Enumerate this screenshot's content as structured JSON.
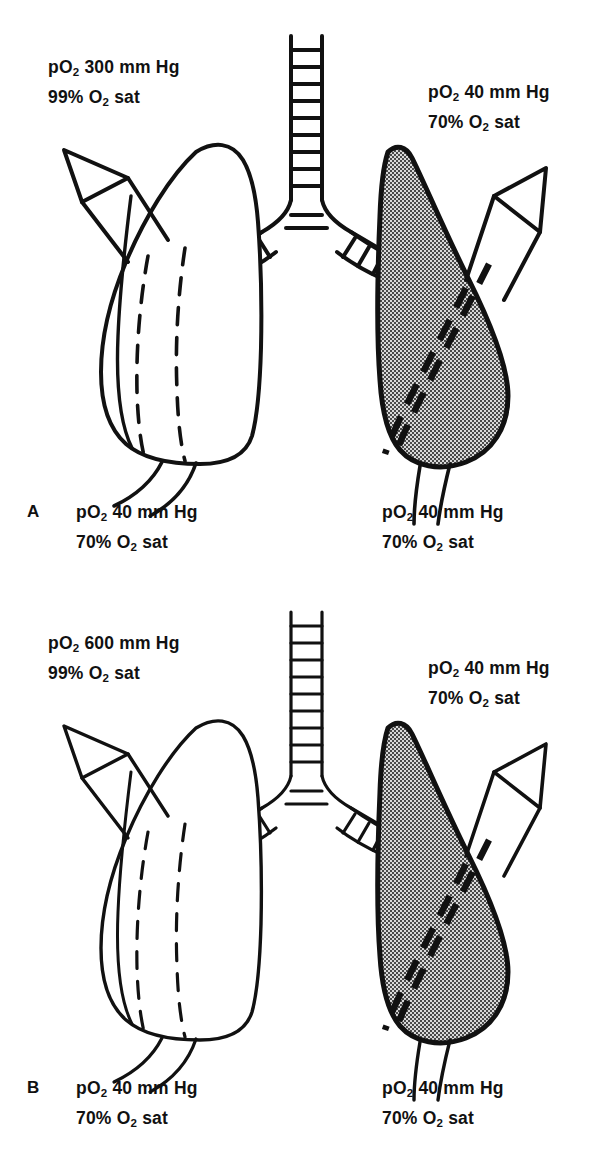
{
  "figure": {
    "type": "medical-diagram",
    "background_color": "#ffffff",
    "ink_color": "#111111",
    "shaded_lung_color": "#8a8a8a"
  },
  "panels": [
    {
      "id": "A",
      "letter": "A",
      "left_lung": {
        "state": "normal-ventilated",
        "fill": "white",
        "arrow_direction": "up-left",
        "inflow_label": {
          "line1_pre": "pO",
          "line1_sub": "2",
          "line1_post": " 300 mm Hg",
          "line2_pre": "99% O",
          "line2_sub": "2",
          "line2_post": " sat"
        },
        "outflow_label": {
          "line1_pre": "pO",
          "line1_sub": "2",
          "line1_post": " 40 mm Hg",
          "line2_pre": "70% O",
          "line2_sub": "2",
          "line2_post": " sat"
        }
      },
      "right_lung": {
        "state": "consolidated-shaded",
        "fill": "gray",
        "arrow_direction": "up-right",
        "inflow_label": {
          "line1_pre": "pO",
          "line1_sub": "2",
          "line1_post": " 40 mm Hg",
          "line2_pre": "70% O",
          "line2_sub": "2",
          "line2_post": " sat"
        },
        "outflow_label": {
          "line1_pre": "pO",
          "line1_sub": "2",
          "line1_post": " 40 mm Hg",
          "line2_pre": "70% O",
          "line2_sub": "2",
          "line2_post": " sat"
        }
      }
    },
    {
      "id": "B",
      "letter": "B",
      "left_lung": {
        "state": "normal-ventilated",
        "fill": "white",
        "arrow_direction": "up-left",
        "inflow_label": {
          "line1_pre": "pO",
          "line1_sub": "2",
          "line1_post": " 600 mm Hg",
          "line2_pre": "99% O",
          "line2_sub": "2",
          "line2_post": " sat"
        },
        "outflow_label": {
          "line1_pre": "pO",
          "line1_sub": "2",
          "line1_post": " 40 mm Hg",
          "line2_pre": "70% O",
          "line2_sub": "2",
          "line2_post": " sat"
        }
      },
      "right_lung": {
        "state": "consolidated-shaded",
        "fill": "gray",
        "arrow_direction": "up-right",
        "inflow_label": {
          "line1_pre": "pO",
          "line1_sub": "2",
          "line1_post": " 40 mm Hg",
          "line2_pre": "70% O",
          "line2_sub": "2",
          "line2_post": " sat"
        },
        "outflow_label": {
          "line1_pre": "pO",
          "line1_sub": "2",
          "line1_post": " 40 mm Hg",
          "line2_pre": "70% O",
          "line2_sub": "2",
          "line2_post": " sat"
        }
      }
    }
  ]
}
